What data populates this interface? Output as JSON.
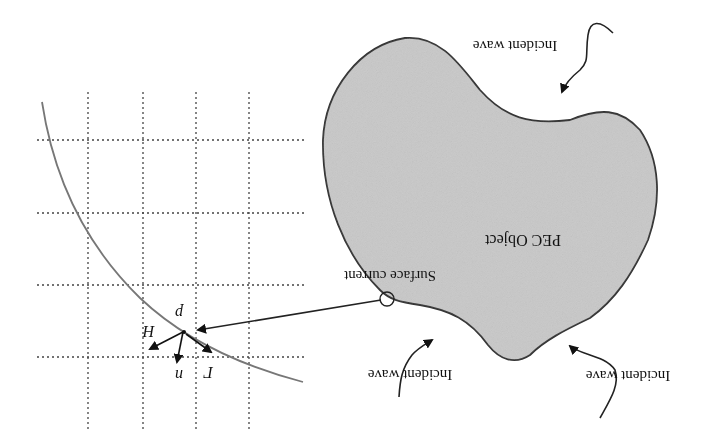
{
  "diagram": {
    "orientation": "rotated-180",
    "object_label": "PEC Object",
    "surface_current_label": "Surface current",
    "incident_wave_labels": [
      "Incident wave",
      "Incident wave",
      "Incident wave"
    ],
    "grid_vectors": {
      "point_label": "p",
      "normal_label": "n",
      "field_label": "H",
      "tangent_label": "Γ"
    },
    "colors": {
      "object_fill": "#c8c8c8",
      "outline": "#333333",
      "grid_line": "#444444",
      "curve": "#777777"
    }
  }
}
